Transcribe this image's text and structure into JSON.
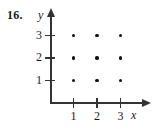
{
  "figure": {
    "exercise_number": "16.",
    "y_axis_name": "y",
    "x_axis_name": "x"
  },
  "chart_data": {
    "type": "scatter",
    "title": "",
    "subtitle": "",
    "xlabel": "x",
    "ylabel": "y",
    "xlim": [
      0,
      3.8
    ],
    "ylim": [
      0,
      3.6
    ],
    "xticks": [
      1,
      2,
      3
    ],
    "yticks": [
      1,
      2,
      3
    ],
    "xtick_labels": [
      "1",
      "2",
      "3"
    ],
    "ytick_labels": [
      "1",
      "2",
      "3"
    ],
    "grid": false,
    "legend": null,
    "legend_position": "none",
    "marker": "filled-circle",
    "marker_color": "#111111",
    "axis_color": "#333333",
    "points": [
      {
        "x": 1,
        "y": 1
      },
      {
        "x": 2,
        "y": 1
      },
      {
        "x": 3,
        "y": 1
      },
      {
        "x": 1,
        "y": 2
      },
      {
        "x": 2,
        "y": 2
      },
      {
        "x": 3,
        "y": 2
      },
      {
        "x": 1,
        "y": 3
      },
      {
        "x": 2,
        "y": 3
      },
      {
        "x": 3,
        "y": 3
      }
    ],
    "x": [
      1,
      2,
      3,
      1,
      2,
      3,
      1,
      2,
      3
    ],
    "values": [
      1,
      1,
      1,
      2,
      2,
      2,
      3,
      3,
      3
    ],
    "annotations": [
      "16."
    ]
  },
  "geometry": {
    "origin_x_px": 50,
    "origin_y_px": 103,
    "unit_x_px": 23.5,
    "unit_y_px": 22.5
  }
}
